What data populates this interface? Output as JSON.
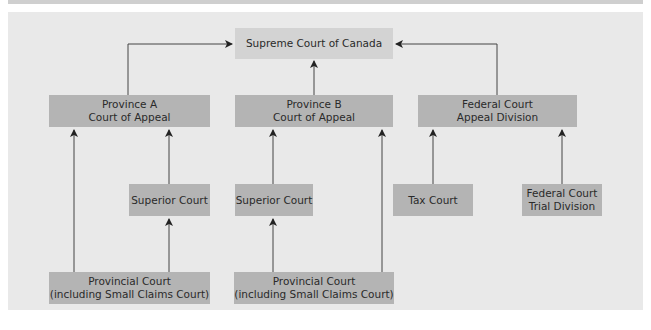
{
  "diagram": {
    "type": "hierarchy",
    "nodes": {
      "supreme": {
        "label": "Supreme Court of Canada"
      },
      "province_a_appeal": {
        "label": "Province A\nCourt of Appeal"
      },
      "province_b_appeal": {
        "label": "Province B\nCourt of Appeal"
      },
      "federal_appeal": {
        "label": "Federal Court\nAppeal Division"
      },
      "superior_a": {
        "label": "Superior Court"
      },
      "superior_b": {
        "label": "Superior Court"
      },
      "tax_court": {
        "label": "Tax Court"
      },
      "federal_trial": {
        "label": "Federal Court\nTrial Division"
      },
      "provincial_a": {
        "label": "Provincial Court\n(including Small Claims Court)"
      },
      "provincial_b": {
        "label": "Provincial Court\n(including Small Claims Court)"
      }
    },
    "edges": [
      {
        "from": "province_a_appeal",
        "to": "supreme"
      },
      {
        "from": "province_b_appeal",
        "to": "supreme"
      },
      {
        "from": "federal_appeal",
        "to": "supreme"
      },
      {
        "from": "provincial_a",
        "to": "province_a_appeal"
      },
      {
        "from": "superior_a",
        "to": "province_a_appeal"
      },
      {
        "from": "provincial_a",
        "to": "superior_a"
      },
      {
        "from": "superior_b",
        "to": "province_b_appeal"
      },
      {
        "from": "provincial_b",
        "to": "superior_b"
      },
      {
        "from": "provincial_b",
        "to": "province_b_appeal"
      },
      {
        "from": "tax_court",
        "to": "federal_appeal"
      },
      {
        "from": "federal_trial",
        "to": "federal_appeal"
      }
    ],
    "colors": {
      "panel_bg": "#e9e9e9",
      "top_box": "#d3d3d3",
      "court_box": "#b4b4b4",
      "line": "#333333"
    }
  }
}
